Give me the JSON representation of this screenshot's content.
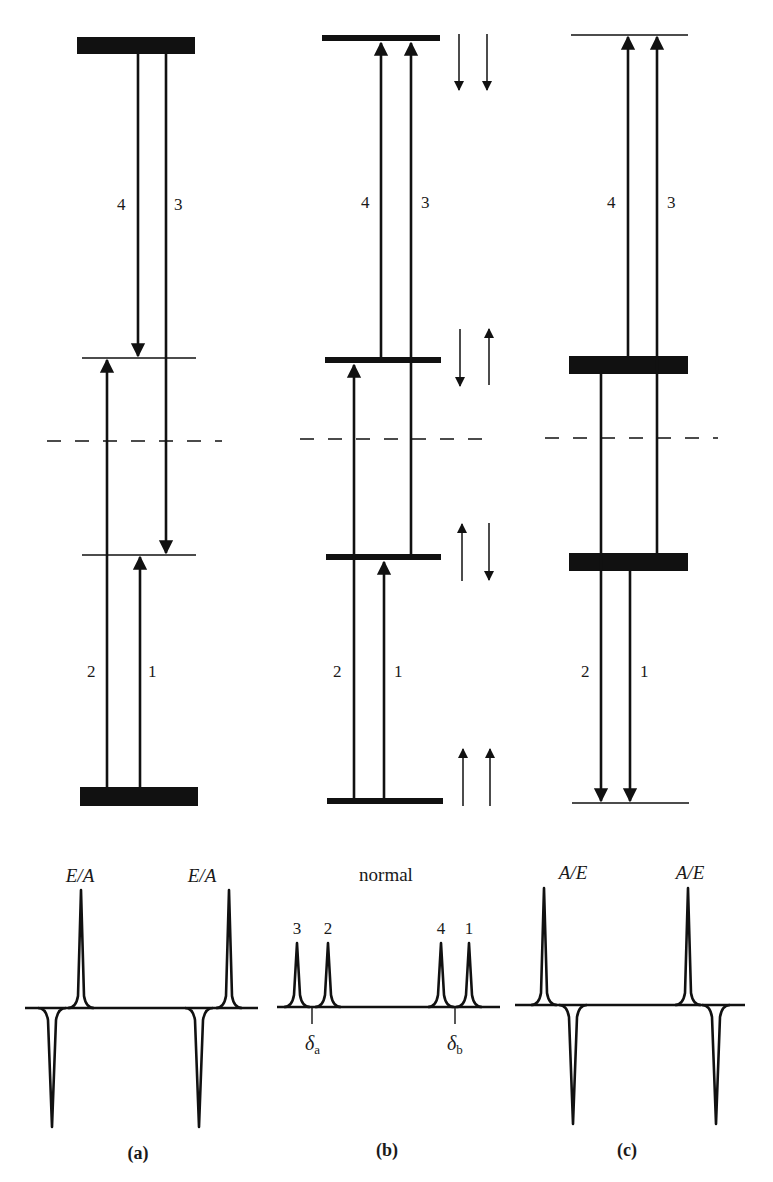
{
  "figure": {
    "panels": [
      {
        "id": "a",
        "caption": "(a)",
        "spectrum_label_left": "E/A",
        "spectrum_label_right": "E/A",
        "transitions": [
          {
            "label": "4",
            "direction": "down"
          },
          {
            "label": "3",
            "direction": "down"
          },
          {
            "label": "2",
            "direction": "up"
          },
          {
            "label": "1",
            "direction": "up"
          }
        ],
        "levels": [
          {
            "name": "top",
            "population": "high"
          },
          {
            "name": "upper-middle",
            "population": "normal"
          },
          {
            "name": "lower-middle",
            "population": "normal"
          },
          {
            "name": "bottom",
            "population": "high"
          }
        ]
      },
      {
        "id": "b",
        "caption": "(b)",
        "spectrum_title": "normal",
        "peak_labels": [
          "3",
          "2",
          "4",
          "1"
        ],
        "shift_labels": {
          "a": "δ",
          "a_sub": "a",
          "b": "δ",
          "b_sub": "b"
        },
        "transitions": [
          {
            "label": "4",
            "direction": "up"
          },
          {
            "label": "3",
            "direction": "up"
          },
          {
            "label": "2",
            "direction": "up"
          },
          {
            "label": "1",
            "direction": "up"
          }
        ],
        "spin_states": [
          [
            "down",
            "down"
          ],
          [
            "down",
            "up"
          ],
          [
            "up",
            "down"
          ],
          [
            "up",
            "up"
          ]
        ]
      },
      {
        "id": "c",
        "caption": "(c)",
        "spectrum_label_left": "A/E",
        "spectrum_label_right": "A/E",
        "transitions": [
          {
            "label": "4",
            "direction": "up"
          },
          {
            "label": "3",
            "direction": "up"
          },
          {
            "label": "2",
            "direction": "down"
          },
          {
            "label": "1",
            "direction": "down"
          }
        ],
        "levels": [
          {
            "name": "top",
            "population": "normal"
          },
          {
            "name": "upper-middle",
            "population": "high"
          },
          {
            "name": "lower-middle",
            "population": "high"
          },
          {
            "name": "bottom",
            "population": "normal"
          }
        ]
      }
    ],
    "colors": {
      "ink": "#111111",
      "background": "#ffffff"
    }
  }
}
